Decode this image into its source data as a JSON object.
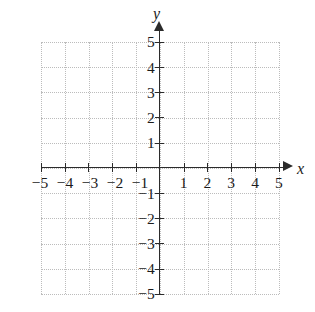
{
  "figure": {
    "kind": "cartesian-coordinate-plane",
    "axis_labels": {
      "x": "x",
      "y": "y"
    },
    "colors": {
      "background": "#ffffff",
      "axis": "#2b2b2b",
      "grid": "#bcbcbc",
      "text": "#1b1b1b"
    }
  },
  "chart_data": {
    "type": "scatter",
    "title": "",
    "subtitle": "",
    "xlabel": "x",
    "ylabel": "y",
    "xlim": [
      -5,
      5
    ],
    "ylim": [
      -5,
      5
    ],
    "xticks": [
      -5,
      -4,
      -3,
      -2,
      -1,
      1,
      2,
      3,
      4,
      5
    ],
    "yticks": [
      -5,
      -4,
      -3,
      -2,
      -1,
      1,
      2,
      3,
      4,
      5
    ],
    "xtick_labels": [
      "−5",
      "−4",
      "−3",
      "−2",
      "−1",
      "1",
      "2",
      "3",
      "4",
      "5"
    ],
    "ytick_labels": [
      "−5",
      "−4",
      "−3",
      "−2",
      "−1",
      "1",
      "2",
      "3",
      "4",
      "5"
    ],
    "grid": true,
    "grid_style": "dotted",
    "grid_step": 1,
    "legend": null,
    "legend_position": "none",
    "series": [],
    "annotations": [],
    "axis_arrows": {
      "x_positive": true,
      "y_positive": true
    },
    "origin_label": ""
  }
}
